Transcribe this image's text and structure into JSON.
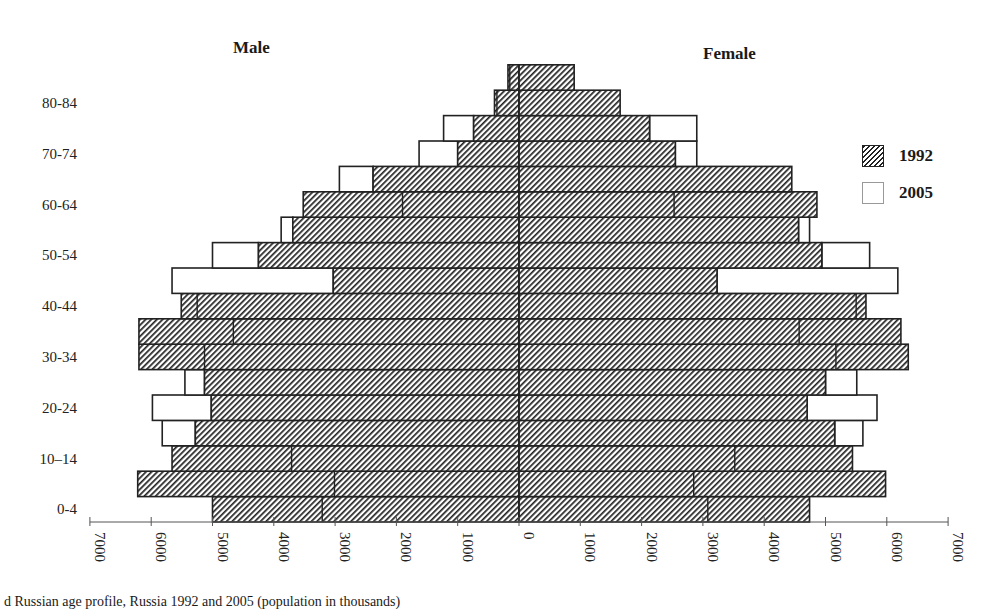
{
  "labels": {
    "male": "Male",
    "female": "Female"
  },
  "legend": [
    {
      "label": "1992",
      "style": "hatched"
    },
    {
      "label": "2005",
      "style": "white"
    }
  ],
  "caption": "d Russian age profile, Russia 1992 and 2005 (population in thousands)",
  "colors": {
    "bar_stroke": "#222222",
    "hatch": "#222222",
    "background": "#ffffff",
    "axis": "#555555"
  },
  "chart_data": {
    "type": "bar",
    "subtype": "population-pyramid",
    "title": "",
    "xlabel": "",
    "ylabel": "",
    "xlim": [
      -7000,
      7000
    ],
    "x_ticks": [
      7000,
      6000,
      5000,
      4000,
      3000,
      2000,
      1000,
      0,
      1000,
      2000,
      3000,
      4000,
      5000,
      6000,
      7000
    ],
    "y_tick_labels": [
      "0-4",
      "10–14",
      "20-24",
      "30-34",
      "40-44",
      "50-54",
      "60-64",
      "70-74",
      "80-84"
    ],
    "categories": [
      "0-4",
      "5-9",
      "10-14",
      "15-19",
      "20-24",
      "25-29",
      "30-34",
      "35-39",
      "40-44",
      "45-49",
      "50-54",
      "55-59",
      "60-64",
      "65-69",
      "70-74",
      "75-79",
      "80-84",
      "85+"
    ],
    "series": [
      {
        "name": "Male 1992",
        "side": "left",
        "values": [
          5000,
          6220,
          5660,
          5280,
          5020,
          5130,
          6200,
          6200,
          5510,
          3030,
          4250,
          3690,
          3520,
          2380,
          1000,
          740,
          400,
          180
        ]
      },
      {
        "name": "Male 2005",
        "side": "left",
        "values": [
          3210,
          3010,
          3710,
          5820,
          5980,
          5450,
          5130,
          4660,
          5250,
          5660,
          5000,
          3880,
          1900,
          2930,
          1630,
          1230,
          360,
          150
        ]
      },
      {
        "name": "Female 1992",
        "side": "right",
        "values": [
          4740,
          5980,
          5440,
          5150,
          4700,
          5000,
          6350,
          6230,
          5660,
          3230,
          4940,
          4560,
          4860,
          4450,
          2550,
          2130,
          1650,
          900
        ]
      },
      {
        "name": "Female 2005",
        "side": "right",
        "values": [
          3080,
          2850,
          3520,
          5610,
          5840,
          5510,
          5170,
          4570,
          5500,
          6180,
          5720,
          4740,
          2530,
          4450,
          2900,
          2900,
          1650,
          900
        ]
      }
    ],
    "legend": {
      "entries": [
        "1992",
        "2005"
      ],
      "position": "right"
    },
    "grid": false
  }
}
